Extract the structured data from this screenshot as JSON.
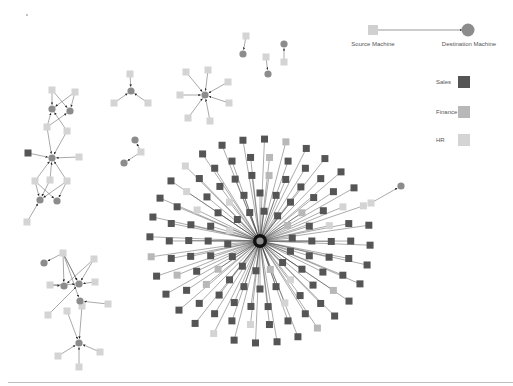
{
  "legend": {
    "edge": {
      "source_label": "Source Machine",
      "destination_label": "Destination Machine"
    },
    "departments": [
      {
        "label": "Sales",
        "color": "#555555"
      },
      {
        "label": "Finance",
        "color": "#b8b8b8"
      },
      {
        "label": "HR",
        "color": "#d4d4d4"
      }
    ]
  },
  "colors": {
    "sales": "#555555",
    "finance": "#b8b8b8",
    "hr": "#d4d4d4",
    "destination": "#8c8c8c",
    "edge": "#6e6e6e",
    "hub_edge": "#3a3a3a"
  },
  "hub": {
    "x": 260,
    "y": 241
  },
  "hub_sources": {
    "rings": [
      {
        "r": 30,
        "count": 14,
        "offset": 5
      },
      {
        "r": 48,
        "count": 20,
        "offset": 0
      },
      {
        "r": 66,
        "count": 26,
        "offset": 7
      },
      {
        "r": 84,
        "count": 30,
        "offset": 3
      },
      {
        "r": 102,
        "count": 32,
        "offset": 9
      }
    ],
    "light_every": 5
  },
  "clusters": [
    {
      "name": "pairs-top",
      "sources": [
        [
          246,
          36,
          "hr"
        ],
        [
          266,
          57,
          "hr"
        ],
        [
          284,
          62,
          "hr"
        ]
      ],
      "destinations": [
        [
          243,
          54
        ],
        [
          268,
          74
        ],
        [
          284,
          44
        ]
      ],
      "edges": [
        [
          0,
          0
        ],
        [
          1,
          1
        ],
        [
          2,
          2
        ]
      ]
    },
    {
      "name": "star-small-1",
      "sources": [
        [
          130,
          74,
          "hr"
        ],
        [
          114,
          103,
          "hr"
        ],
        [
          148,
          103,
          "hr"
        ]
      ],
      "destinations": [
        [
          131,
          91
        ]
      ],
      "edges": [
        [
          0,
          0
        ],
        [
          1,
          0
        ],
        [
          2,
          0
        ]
      ]
    },
    {
      "name": "star-small-2",
      "sources": [
        [
          186,
          72,
          "hr"
        ],
        [
          208,
          70,
          "hr"
        ],
        [
          228,
          82,
          "hr"
        ],
        [
          180,
          95,
          "hr"
        ],
        [
          229,
          103,
          "hr"
        ],
        [
          188,
          118,
          "hr"
        ],
        [
          210,
          121,
          "hr"
        ]
      ],
      "destinations": [
        [
          205,
          95
        ]
      ],
      "edges": [
        [
          0,
          0
        ],
        [
          1,
          0
        ],
        [
          2,
          0
        ],
        [
          3,
          0
        ],
        [
          4,
          0
        ],
        [
          5,
          0
        ],
        [
          6,
          0
        ]
      ]
    },
    {
      "name": "left-chain",
      "sources": [
        [
          52,
          90,
          "hr"
        ],
        [
          75,
          92,
          "hr"
        ],
        [
          47,
          127,
          "hr"
        ],
        [
          67,
          131,
          "hr"
        ],
        [
          28,
          153,
          "sales"
        ],
        [
          79,
          157,
          "hr"
        ],
        [
          35,
          181,
          "hr"
        ],
        [
          50,
          180,
          "hr"
        ],
        [
          67,
          181,
          "hr"
        ],
        [
          27,
          222,
          "hr"
        ]
      ],
      "destinations": [
        [
          52,
          109
        ],
        [
          70,
          111
        ],
        [
          52,
          158
        ],
        [
          40,
          200
        ],
        [
          57,
          201
        ]
      ],
      "edges": [
        [
          0,
          0
        ],
        [
          0,
          1
        ],
        [
          1,
          0
        ],
        [
          1,
          1
        ],
        [
          2,
          0
        ],
        [
          2,
          1
        ],
        [
          3,
          0
        ],
        [
          2,
          2
        ],
        [
          3,
          2
        ],
        [
          4,
          2
        ],
        [
          5,
          2
        ],
        [
          6,
          2
        ],
        [
          7,
          2
        ],
        [
          8,
          2
        ],
        [
          6,
          3
        ],
        [
          6,
          4
        ],
        [
          7,
          3
        ],
        [
          8,
          4
        ],
        [
          8,
          3
        ],
        [
          9,
          3
        ]
      ]
    },
    {
      "name": "left-bottom",
      "sources": [
        [
          63,
          253,
          "hr"
        ],
        [
          94,
          259,
          "hr"
        ],
        [
          50,
          285,
          "hr"
        ],
        [
          95,
          282,
          "hr"
        ],
        [
          82,
          306,
          "hr"
        ],
        [
          67,
          311,
          "hr"
        ],
        [
          108,
          304,
          "hr"
        ],
        [
          48,
          315,
          "hr"
        ],
        [
          58,
          356,
          "hr"
        ],
        [
          100,
          352,
          "hr"
        ],
        [
          79,
          367,
          "hr"
        ]
      ],
      "destinations": [
        [
          44,
          263
        ],
        [
          64,
          286
        ],
        [
          79,
          284
        ],
        [
          80,
          301
        ],
        [
          79,
          343
        ]
      ],
      "edges": [
        [
          0,
          0
        ],
        [
          0,
          1
        ],
        [
          0,
          2
        ],
        [
          1,
          2
        ],
        [
          2,
          1
        ],
        [
          3,
          2
        ],
        [
          0,
          3
        ],
        [
          4,
          3
        ],
        [
          6,
          3
        ],
        [
          7,
          2
        ],
        [
          5,
          4
        ],
        [
          4,
          4
        ],
        [
          8,
          4
        ],
        [
          9,
          4
        ],
        [
          10,
          4
        ],
        [
          0,
          2
        ],
        [
          1,
          1
        ],
        [
          2,
          2
        ]
      ]
    },
    {
      "name": "outliers",
      "sources": [
        [
          141,
          152,
          "hr"
        ],
        [
          371,
          203,
          "hr"
        ]
      ],
      "destinations": [
        [
          135,
          140
        ],
        [
          124,
          163
        ],
        [
          401,
          186
        ]
      ],
      "edges": [
        [
          0,
          0
        ],
        [
          0,
          1
        ],
        [
          1,
          2
        ]
      ]
    }
  ]
}
